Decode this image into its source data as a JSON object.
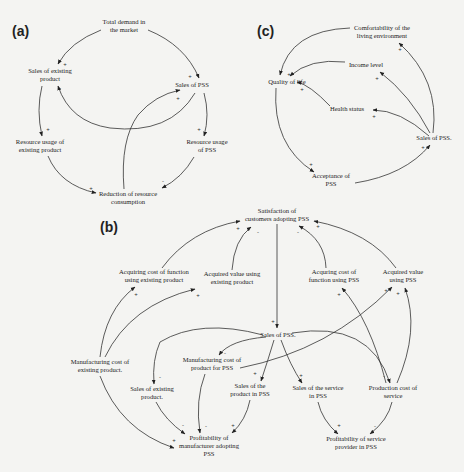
{
  "panels": {
    "a": {
      "label": "(a)",
      "nodes": {
        "total_demand": [
          "Total demand in",
          "the market"
        ],
        "sales_existing": [
          "Sales of existing",
          "product"
        ],
        "sales_pss": [
          "Sales of PSS"
        ],
        "resource_existing": [
          "Resource usage of",
          "existing product"
        ],
        "resource_pss": [
          "Resource usage",
          "of PSS"
        ],
        "reduction": [
          "Reduction of resource",
          "consumption"
        ]
      },
      "edges": [
        {
          "from": "total_demand",
          "to": "sales_existing",
          "sign": "+"
        },
        {
          "from": "total_demand",
          "to": "sales_pss",
          "sign": "+"
        },
        {
          "from": "sales_pss",
          "to": "sales_existing",
          "sign": "-"
        },
        {
          "from": "sales_existing",
          "to": "resource_existing",
          "sign": "+"
        },
        {
          "from": "sales_pss",
          "to": "resource_pss",
          "sign": "+"
        },
        {
          "from": "resource_existing",
          "to": "reduction",
          "sign": "+"
        },
        {
          "from": "resource_pss",
          "to": "reduction",
          "sign": "-"
        },
        {
          "from": "reduction",
          "to": "sales_pss",
          "sign": "+"
        }
      ]
    },
    "c": {
      "label": "(c)",
      "nodes": {
        "comfort": [
          "Comfortability of the",
          "living environment"
        ],
        "income": [
          "Income level"
        ],
        "quality": [
          "Quality of life"
        ],
        "health": [
          "Health status"
        ],
        "sales_pss": [
          "Sales of PSS."
        ],
        "acceptance": [
          "Acceptance of",
          "PSS"
        ]
      },
      "edges": [
        {
          "from": "sales_pss",
          "to": "comfort",
          "sign": "+"
        },
        {
          "from": "sales_pss",
          "to": "income",
          "sign": "+"
        },
        {
          "from": "sales_pss",
          "to": "health",
          "sign": "+"
        },
        {
          "from": "comfort",
          "to": "quality",
          "sign": "+"
        },
        {
          "from": "income",
          "to": "quality",
          "sign": "+"
        },
        {
          "from": "health",
          "to": "quality",
          "sign": "+"
        },
        {
          "from": "quality",
          "to": "acceptance",
          "sign": "+"
        },
        {
          "from": "acceptance",
          "to": "sales_pss",
          "sign": "+"
        }
      ]
    },
    "b": {
      "label": "(b)",
      "nodes": {
        "satisfaction": [
          "Satisfaction of",
          "customers adopting PSS"
        ],
        "acq_cost_existing": [
          "Acquiring cost of function",
          "using existing product"
        ],
        "acq_value_existing": [
          "Acquired value using",
          "existing product"
        ],
        "acq_cost_pss": [
          "Acquring cost of",
          "function using PSS"
        ],
        "acq_value_pss": [
          "Acquired value",
          "using PSS"
        ],
        "sales_pss": [
          "Sales of PSS."
        ],
        "mfg_cost_existing": [
          "Manufacturing cost of",
          "existing product."
        ],
        "mfg_cost_pss": [
          "Manufacturing cost of",
          "product for PSS"
        ],
        "sales_existing": [
          "Sales of existing",
          "product."
        ],
        "sales_product_pss": [
          "Sales of the",
          "product in PSS"
        ],
        "sales_service_pss": [
          "Sales of the service",
          "in PSS"
        ],
        "production_cost_service": [
          "Production cost of",
          "service"
        ],
        "profit_manufacturer": [
          "Profitability of",
          "manufacturer adopting",
          "PSS"
        ],
        "profit_service": [
          "Profitability of service",
          "provider in PSS"
        ]
      },
      "signs": [
        "+",
        "-",
        "-",
        "+",
        "+",
        "+",
        "+",
        "+",
        "+",
        "-",
        "+",
        "+",
        "-",
        "-",
        "+",
        "-",
        "+",
        "-",
        "+",
        "-",
        "-",
        "+"
      ]
    }
  }
}
